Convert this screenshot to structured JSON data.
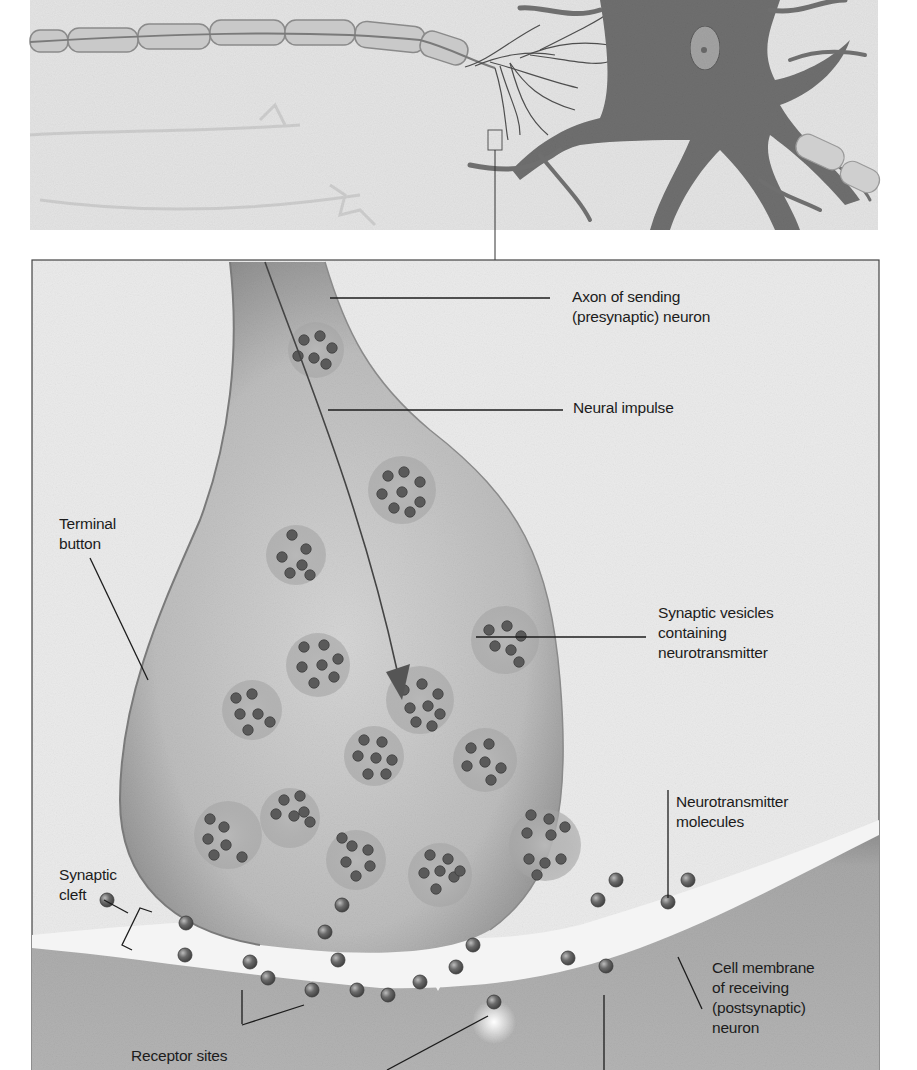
{
  "diagram": {
    "type": "anatomical-illustration",
    "colors": {
      "background": "#ffffff",
      "panel_bg": "#e6e6e6",
      "neuron_dark": "#6e6e6e",
      "terminal_fill": "#c2c2c2",
      "vesicle": "#5e5e5e",
      "cleft": "#efefef",
      "postsynaptic": "#a9a9a9",
      "label_text": "#1c1c1c",
      "leader_line": "#1c1c1c"
    },
    "top_panel": {
      "description": "Overview of neurons with myelinated axon and dendrite branches; small box marks the synapse region enlarged below"
    },
    "labels": {
      "axon": "Axon of sending\n(presynaptic) neuron",
      "neural_impulse": "Neural impulse",
      "terminal_button": "Terminal\nbutton",
      "synaptic_vesicles": "Synaptic vesicles\ncontaining\nneurotransmitter",
      "neurotransmitter_molecules": "Neurotransmitter\nmolecules",
      "synaptic_cleft": "Synaptic\ncleft",
      "cell_membrane": "Cell membrane\nof receiving\n(postsynaptic)\nneuron",
      "receptor_sites": "Receptor sites"
    }
  }
}
